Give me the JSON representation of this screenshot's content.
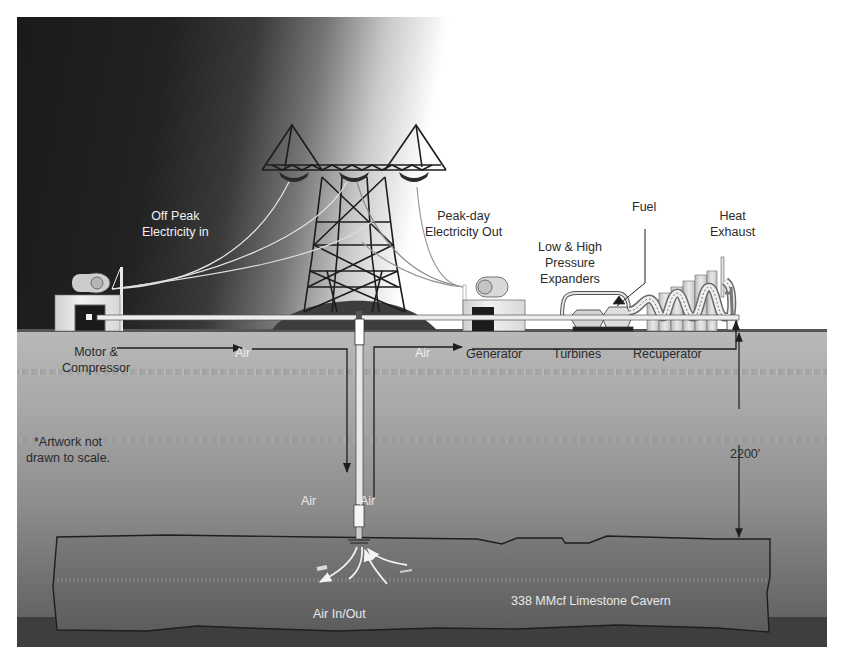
{
  "diagram": {
    "labels": {
      "off_peak_line1": "Off Peak",
      "off_peak_line2": "Electricity in",
      "peak_day_line1": "Peak-day",
      "peak_day_line2": "Electricity Out",
      "expanders_line1": "Low & High",
      "expanders_line2": "Pressure",
      "expanders_line3": "Expanders",
      "fuel": "Fuel",
      "heat_line1": "Heat",
      "heat_line2": "Exhaust",
      "motor_line1": "Motor &",
      "motor_line2": "Compressor",
      "air_left": "Air",
      "air_right": "Air",
      "generator": "Generator",
      "turbines": "Turbines",
      "recuperator": "Recuperator",
      "depth": "2200'",
      "note_line1": "*Artwork not",
      "note_line2": "drawn to scale.",
      "air_down": "Air",
      "air_up": "Air",
      "air_in_out": "Air In/Out",
      "cavern": "338 MMcf Limestone Cavern"
    },
    "components": [
      "Motor & Compressor",
      "Transmission Tower",
      "Generator",
      "Turbines",
      "Recuperator",
      "Well Shaft",
      "Limestone Cavern"
    ],
    "colors": {
      "sky_dark": "#1a1a1a",
      "ground": "#a8a8a8",
      "cavern": "#6e6e6e",
      "line": "#1e1e1e"
    }
  }
}
